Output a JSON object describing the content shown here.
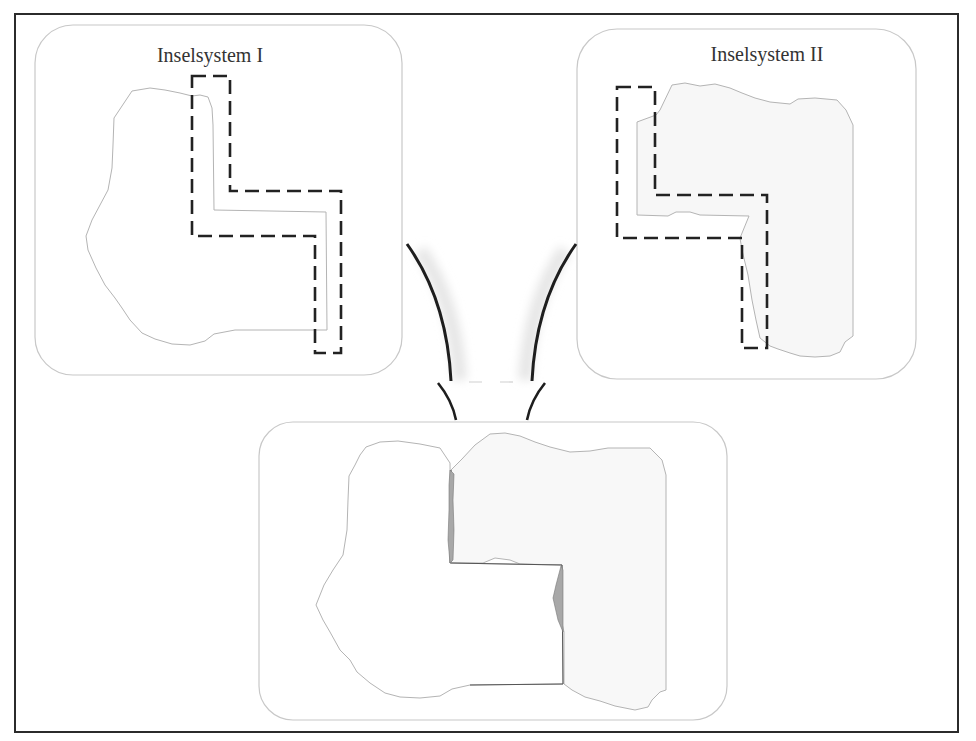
{
  "diagram": {
    "type": "island-system-merge",
    "panels": [
      {
        "id": "island-system-1",
        "title": "Inselsystem I"
      },
      {
        "id": "island-system-2",
        "title": "Inselsystem II"
      },
      {
        "id": "merged-result",
        "title": ""
      }
    ],
    "colors": {
      "frame": "#2b2b2b",
      "panel_border": "#c8c8c8",
      "island_outline": "#b4b4b4",
      "island_fill": "#ffffff",
      "island2_fill": "#f7f7f7",
      "dashed_boundary": "#222222",
      "overlap_fill": "#a8a8a8",
      "arrow": "#1e1e1e",
      "arrow_shadow": "#ececec"
    }
  }
}
